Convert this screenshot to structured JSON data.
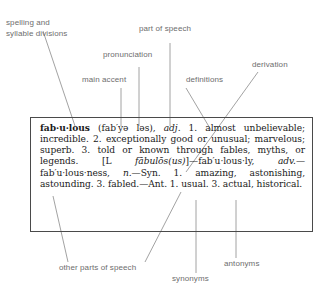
{
  "diagram": {
    "box_border_color": "#4a4a4a",
    "label_color": "#6d6d6d",
    "text_color": "#1a1a1a"
  },
  "callouts": {
    "spelling": "spelling and\nsyllable divisions",
    "part_of_speech": "part of speech",
    "pronunciation": "pronunciation",
    "main_accent": "main accent",
    "definitions": "definitions",
    "derivation": "derivation",
    "other_parts_of_speech": "other parts of speech",
    "synonyms": "synonyms",
    "antonyms": "antonyms"
  },
  "entry": {
    "headword": "fab·u·lous",
    "pronunciation": "(fab′yə ləs),",
    "part_of_speech": "adj.",
    "definitions_text": " 1. almost unbelievable; incredible. 2. exceptionally good or unusual; marvelous; superb. 3. told or known through fables, myths, or legends. ",
    "etymology_open": "[L ",
    "etymology_italic": "fābulōs(us)",
    "etymology_close": "]",
    "derived_1": "—fab′u·lous·ly, ",
    "derived_1_pos": "adv.",
    "derived_2": "—fab′u·lous·ness, ",
    "derived_2_pos": "n.",
    "synonyms_text": "—Syn. 1. amazing, astonishing, astounding. 3. fabled.",
    "antonyms_text": "—Ant. 1. usual. 3. actual, historical."
  }
}
